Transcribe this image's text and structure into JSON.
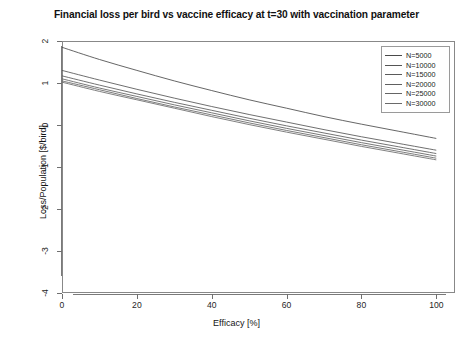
{
  "chart_data": {
    "type": "line",
    "title": "Financial loss per bird vs vaccine efficacy at t=30 with vaccination parameter",
    "xlabel": "Efficacy [%]",
    "ylabel": "Loss/Population [$/bird]",
    "xlim": [
      0,
      105
    ],
    "ylim": [
      -4,
      2
    ],
    "xticks": [
      0,
      20,
      40,
      60,
      80,
      100
    ],
    "xtick_labels": [
      "0",
      "20",
      "40",
      "60",
      "80",
      "100"
    ],
    "yticks": [
      2,
      1,
      0,
      -1,
      -2,
      -3,
      -4
    ],
    "ytick_labels": [
      "2",
      "1",
      "0",
      "-1",
      "-2",
      "-3",
      "-4"
    ],
    "grid": false,
    "legend_position": "top-right",
    "x": [
      0,
      10,
      20,
      30,
      40,
      50,
      60,
      70,
      80,
      90,
      100
    ],
    "series": [
      {
        "name": "N=5000",
        "color": "#4a4a4a",
        "values": [
          1.85,
          1.56,
          1.3,
          1.05,
          0.82,
          0.6,
          0.4,
          0.2,
          0.02,
          -0.15,
          -0.32
        ]
      },
      {
        "name": "N=10000",
        "color": "#555555",
        "values": [
          1.3,
          1.07,
          0.85,
          0.64,
          0.44,
          0.25,
          0.07,
          -0.11,
          -0.28,
          -0.44,
          -0.6
        ]
      },
      {
        "name": "N=15000",
        "color": "#5a5a5a",
        "values": [
          1.17,
          0.95,
          0.74,
          0.54,
          0.35,
          0.16,
          -0.02,
          -0.19,
          -0.36,
          -0.52,
          -0.68
        ]
      },
      {
        "name": "N=20000",
        "color": "#606060",
        "values": [
          1.1,
          0.88,
          0.68,
          0.48,
          0.29,
          0.1,
          -0.08,
          -0.25,
          -0.42,
          -0.58,
          -0.74
        ]
      },
      {
        "name": "N=25000",
        "color": "#656565",
        "values": [
          1.05,
          0.84,
          0.63,
          0.43,
          0.24,
          0.05,
          -0.13,
          -0.3,
          -0.47,
          -0.63,
          -0.79
        ]
      },
      {
        "name": "N=30000",
        "color": "#6a6a6a",
        "values": [
          1.02,
          0.8,
          0.6,
          0.4,
          0.2,
          0.01,
          -0.17,
          -0.34,
          -0.51,
          -0.67,
          -0.83
        ]
      }
    ]
  },
  "legend": {
    "entries": [
      "N=5000",
      "N=10000",
      "N=15000",
      "N=20000",
      "N=25000",
      "N=30000"
    ]
  }
}
